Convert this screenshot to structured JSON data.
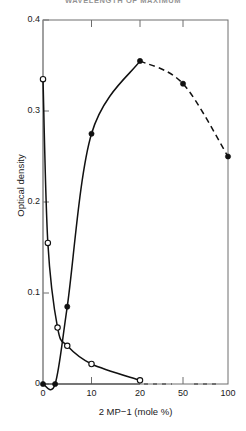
{
  "chart_data": {
    "type": "line",
    "title": "WAVELENGTH OF MAXIMUM",
    "xlabel": "2 MP−1 (mole %)",
    "ylabel": "Optical density",
    "xlim": [
      0,
      100
    ],
    "ylim": [
      0,
      0.4
    ],
    "x_tick_labels": [
      "0",
      "10",
      "20",
      "50",
      "100"
    ],
    "x_tick_values": [
      0,
      10,
      20,
      50,
      100
    ],
    "y_tick_labels": [
      "0",
      "0.1",
      "0.2",
      "0.3",
      "0.4"
    ],
    "y_tick_values": [
      0,
      0.1,
      0.2,
      0.3,
      0.4
    ],
    "x_axis_break": true,
    "x_axis_break_style": "dashed",
    "grid": false,
    "legend": null,
    "series": [
      {
        "name": "rising-curve-filled",
        "marker": "filled-circle",
        "linestyle_solid_to_x": 20,
        "linestyle_dashed_from_x": 20,
        "points": [
          {
            "x": 0,
            "y": 0.0
          },
          {
            "x": 2.5,
            "y": 0.0
          },
          {
            "x": 5,
            "y": 0.085
          },
          {
            "x": 10,
            "y": 0.275
          },
          {
            "x": 20,
            "y": 0.355
          },
          {
            "x": 50,
            "y": 0.33
          },
          {
            "x": 100,
            "y": 0.25
          }
        ]
      },
      {
        "name": "falling-curve-open",
        "marker": "open-circle",
        "linestyle": "solid",
        "points": [
          {
            "x": 0,
            "y": 0.335
          },
          {
            "x": 1,
            "y": 0.155
          },
          {
            "x": 3,
            "y": 0.062
          },
          {
            "x": 5,
            "y": 0.042
          },
          {
            "x": 10,
            "y": 0.022
          },
          {
            "x": 20,
            "y": 0.004
          }
        ]
      }
    ]
  },
  "axes": {
    "y_title": "Optical density",
    "x_title": "2 MP−1 (mole %)"
  },
  "title": {
    "text": "WAVELENGTH OF MAXIMUM"
  },
  "colors": {
    "frame": "#6e6e6e",
    "curve": "#111111",
    "marker_fill": "#111111",
    "marker_open": "#ffffff",
    "background": "#ffffff"
  }
}
